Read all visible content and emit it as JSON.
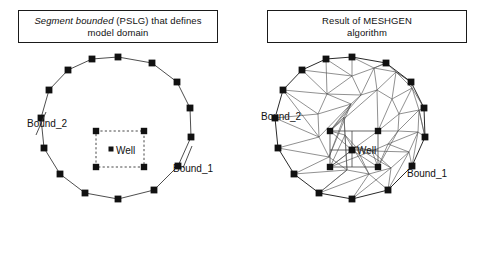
{
  "figure": {
    "background": "#ffffff",
    "line_color": "#333333",
    "node_color": "#111111",
    "text_color": "#111111"
  },
  "panels": [
    {
      "id": "pslg-domain",
      "caption_line1_italic": "Segment bounded",
      "caption_line1_rest": " (PSLG) that defines",
      "caption_line2": "model domain",
      "caption_plain": "Segment bounded (PSLG) that defines model domain",
      "labels": {
        "bound_left": "Bound_2",
        "bound_right": "Bound_1",
        "well": "Well"
      }
    },
    {
      "id": "meshgen-result",
      "caption_line1": "Result of MESHGEN",
      "caption_line2": "algorithm",
      "caption_plain": "Result of MESHGEN algorithm",
      "labels": {
        "bound_left": "Bound_2",
        "bound_right": "Bound_1",
        "well": "Well"
      }
    }
  ],
  "geometry": {
    "polygon_vertices_count": 16,
    "inner_square_corners_count": 4,
    "well_points_count": 1,
    "left_polygon": [
      [
        118,
        57
      ],
      [
        152,
        63
      ],
      [
        177,
        82
      ],
      [
        190,
        108
      ],
      [
        191,
        137
      ],
      [
        178,
        166
      ],
      [
        154,
        190
      ],
      [
        118,
        199
      ],
      [
        85,
        193
      ],
      [
        60,
        174
      ],
      [
        44,
        148
      ],
      [
        41,
        118
      ],
      [
        49,
        90
      ],
      [
        68,
        70
      ],
      [
        92,
        59
      ],
      [
        118,
        57
      ]
    ],
    "left_inner_square": [
      [
        96,
        131
      ],
      [
        144,
        131
      ],
      [
        144,
        167
      ],
      [
        96,
        167
      ]
    ],
    "left_well": [
      118,
      150
    ],
    "right_polygon": [
      [
        352,
        57
      ],
      [
        386,
        63
      ],
      [
        411,
        82
      ],
      [
        424,
        108
      ],
      [
        425,
        137
      ],
      [
        412,
        166
      ],
      [
        388,
        190
      ],
      [
        352,
        199
      ],
      [
        319,
        193
      ],
      [
        294,
        174
      ],
      [
        278,
        148
      ],
      [
        275,
        118
      ],
      [
        283,
        90
      ],
      [
        302,
        70
      ],
      [
        326,
        59
      ],
      [
        352,
        57
      ]
    ],
    "right_inner_square": [
      [
        330,
        131
      ],
      [
        378,
        131
      ],
      [
        378,
        167
      ],
      [
        330,
        167
      ]
    ],
    "right_well": [
      352,
      150
    ]
  }
}
